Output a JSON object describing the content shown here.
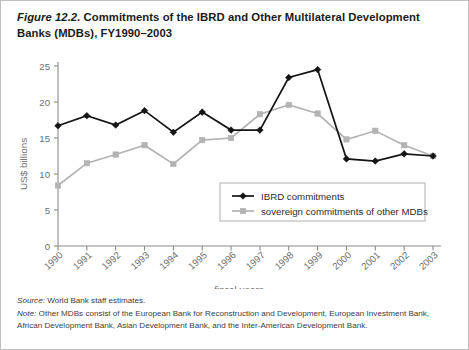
{
  "figure": {
    "number": "Figure 12.2.",
    "title_text": " Commitments of the IBRD and Other Multilateral Development Banks (MDBs), FY1990–2003",
    "source_label": "Source:",
    "source_text": " World Bank staff estimates.",
    "note_label": "Note:",
    "note_text": " Other MDBs consist of the European Bank for Reconstruction and Development, European Investment Bank, African Development Bank, Asian Development Bank, and the Inter-American Development Bank."
  },
  "colors": {
    "ibrd": "#141414",
    "mdb": "#b3b3b3",
    "axis": "#8c8c8c",
    "tick_text": "#6e6e6e",
    "frame": "#bfbfbf",
    "title_text": "#1b1b1b",
    "note_text": "#3d3d3d",
    "legend_border": "#b0b0b0"
  },
  "chart_data": {
    "type": "line",
    "title": "Commitments of the IBRD and Other Multilateral Development Banks (MDBs), FY1990–2003",
    "xlabel": "fiscal years",
    "ylabel": "US$ billions",
    "categories": [
      "1990",
      "1991",
      "1992",
      "1993",
      "1994",
      "1995",
      "1996",
      "1997",
      "1998",
      "1999",
      "2000",
      "2001",
      "2002",
      "2003"
    ],
    "yticks": [
      0,
      5,
      10,
      15,
      20,
      25
    ],
    "ylim": [
      0,
      25
    ],
    "grid": false,
    "legend_position": "inside-bottom-right",
    "series": [
      {
        "name": "IBRD commitments",
        "color": "#141414",
        "marker": "diamond",
        "values": [
          16.7,
          18.1,
          16.8,
          18.8,
          15.8,
          18.6,
          16.1,
          16.1,
          23.4,
          24.5,
          12.1,
          11.8,
          12.8,
          12.5
        ]
      },
      {
        "name": "sovereign commitments of other MDBs",
        "color": "#b3b3b3",
        "marker": "square",
        "values": [
          8.4,
          11.5,
          12.7,
          14.0,
          11.4,
          14.7,
          15.0,
          18.3,
          19.6,
          18.4,
          14.8,
          16.0,
          14.0,
          12.5
        ]
      }
    ]
  }
}
